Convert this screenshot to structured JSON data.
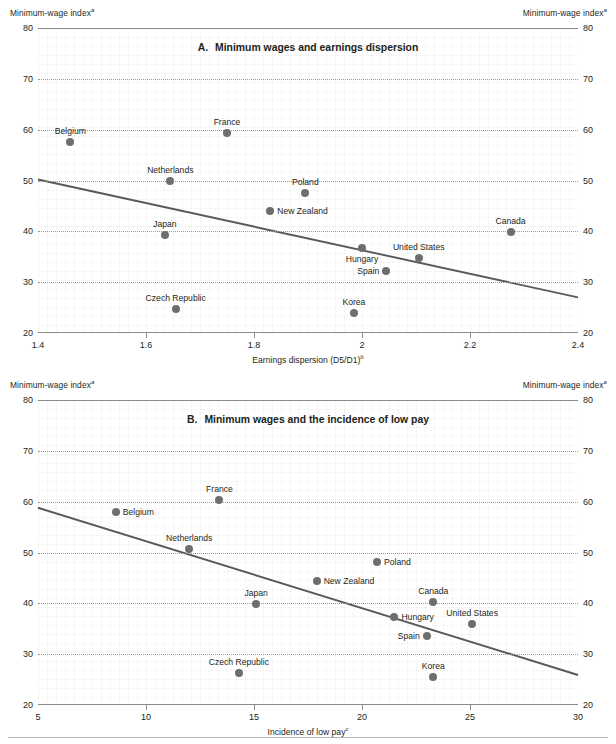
{
  "axis_corner_label": "Minimum-wage index",
  "axis_corner_sup": "a",
  "panels": [
    {
      "id": "A",
      "letter": "A.",
      "title": "Minimum wages and earnings dispersion",
      "xlabel": "Earnings dispersion (D5/D1)",
      "xlabel_sup": "b",
      "xticks": [
        "1.4",
        "1.6",
        "1.8",
        "2",
        "2.2",
        "2.4"
      ],
      "yticks": [
        "20",
        "30",
        "40",
        "50",
        "60",
        "70",
        "80"
      ]
    },
    {
      "id": "B",
      "letter": "B.",
      "title": "Minimum wages and the incidence of low pay",
      "xlabel": "Incidence of low pay",
      "xlabel_sup": "c",
      "xticks": [
        "5",
        "10",
        "15",
        "20",
        "25",
        "30"
      ],
      "yticks": [
        "20",
        "30",
        "40",
        "50",
        "60",
        "70",
        "80"
      ]
    }
  ],
  "chart_data": [
    {
      "type": "scatter",
      "panel": "A",
      "title": "A.   Minimum wages and earnings dispersion",
      "xlabel": "Earnings dispersion (D5/D1)",
      "ylabel": "Minimum-wage index",
      "xlim": [
        1.4,
        2.4
      ],
      "ylim": [
        20,
        80
      ],
      "xticks": [
        1.4,
        1.6,
        1.8,
        2.0,
        2.2,
        2.4
      ],
      "yticks": [
        20,
        30,
        40,
        50,
        60,
        70,
        80
      ],
      "grid": "horizontal-dotted",
      "legend": "none",
      "points": [
        {
          "label": "Belgium",
          "x": 1.46,
          "y": 57.5,
          "label_pos": "above"
        },
        {
          "label": "France",
          "x": 1.75,
          "y": 59.3,
          "label_pos": "above"
        },
        {
          "label": "Netherlands",
          "x": 1.645,
          "y": 50.0,
          "label_pos": "above"
        },
        {
          "label": "Poland",
          "x": 1.895,
          "y": 47.5,
          "label_pos": "above"
        },
        {
          "label": "New Zealand",
          "x": 1.83,
          "y": 44.0,
          "label_pos": "right"
        },
        {
          "label": "Japan",
          "x": 1.635,
          "y": 39.3,
          "label_pos": "above"
        },
        {
          "label": "Canada",
          "x": 2.275,
          "y": 39.8,
          "label_pos": "above"
        },
        {
          "label": "Hungary",
          "x": 2.0,
          "y": 36.8,
          "label_pos": "below"
        },
        {
          "label": "United States",
          "x": 2.105,
          "y": 34.8,
          "label_pos": "above"
        },
        {
          "label": "Spain",
          "x": 2.045,
          "y": 32.2,
          "label_pos": "left"
        },
        {
          "label": "Czech Republic",
          "x": 1.655,
          "y": 24.8,
          "label_pos": "above"
        },
        {
          "label": "Korea",
          "x": 1.985,
          "y": 24.0,
          "label_pos": "above"
        }
      ],
      "trendline": {
        "x1": 1.4,
        "y1": 50.2,
        "x2": 2.4,
        "y2": 27.0
      }
    },
    {
      "type": "scatter",
      "panel": "B",
      "title": "B.   Minimum wages and the incidence of low pay",
      "xlabel": "Incidence of low pay",
      "ylabel": "Minimum-wage index",
      "xlim": [
        5,
        30
      ],
      "ylim": [
        20,
        80
      ],
      "xticks": [
        5,
        10,
        15,
        20,
        25,
        30
      ],
      "yticks": [
        20,
        30,
        40,
        50,
        60,
        70,
        80
      ],
      "grid": "horizontal-dotted",
      "legend": "none",
      "points": [
        {
          "label": "France",
          "x": 13.4,
          "y": 60.3,
          "label_pos": "above"
        },
        {
          "label": "Belgium",
          "x": 8.6,
          "y": 58.0,
          "label_pos": "right"
        },
        {
          "label": "Netherlands",
          "x": 12.0,
          "y": 50.7,
          "label_pos": "above"
        },
        {
          "label": "Poland",
          "x": 20.7,
          "y": 48.2,
          "label_pos": "right"
        },
        {
          "label": "New Zealand",
          "x": 17.9,
          "y": 44.3,
          "label_pos": "right"
        },
        {
          "label": "Japan",
          "x": 15.1,
          "y": 39.8,
          "label_pos": "above"
        },
        {
          "label": "Canada",
          "x": 23.3,
          "y": 40.3,
          "label_pos": "above"
        },
        {
          "label": "Hungary",
          "x": 21.5,
          "y": 37.3,
          "label_pos": "right"
        },
        {
          "label": "United States",
          "x": 25.1,
          "y": 36.0,
          "label_pos": "above"
        },
        {
          "label": "Spain",
          "x": 23.0,
          "y": 33.5,
          "label_pos": "left"
        },
        {
          "label": "Czech Republic",
          "x": 14.3,
          "y": 26.3,
          "label_pos": "above"
        },
        {
          "label": "Korea",
          "x": 23.3,
          "y": 25.5,
          "label_pos": "above"
        }
      ],
      "trendline": {
        "x1": 5.0,
        "y1": 58.8,
        "x2": 30.0,
        "y2": 25.9
      }
    }
  ]
}
